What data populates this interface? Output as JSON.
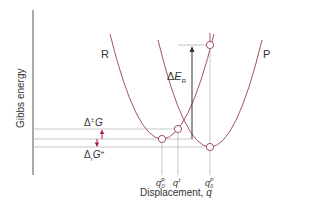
{
  "diagram": {
    "y_axis_label": "Gibbs energy",
    "x_axis_label": "Displacement, ",
    "x_axis_var": "q",
    "curve_labels": {
      "reactant": "R",
      "product": "P"
    },
    "annotations": {
      "activation": {
        "delta": "Δ",
        "sup": "‡",
        "sym": "G"
      },
      "reaction": {
        "delta": "Δ",
        "sub": "r",
        "sym": "G",
        "sup": "⦵"
      },
      "reorganization": {
        "delta": "Δ",
        "sym": "E",
        "sub": "R"
      }
    },
    "x_ticks": [
      {
        "sym": "q",
        "sup": "R",
        "sub": "0"
      },
      {
        "sym": "q",
        "sup": "‡",
        "sub": ""
      },
      {
        "sym": "q",
        "sup": "P",
        "sub": "0"
      }
    ],
    "colors": {
      "curve": "#a0526a",
      "arrow": "#b0174a",
      "guide": "#b9b9b9",
      "axis": "#555555",
      "baseline_start": "#d4a9a9",
      "baseline_end": "#5fd66f",
      "text": "#333333"
    }
  }
}
